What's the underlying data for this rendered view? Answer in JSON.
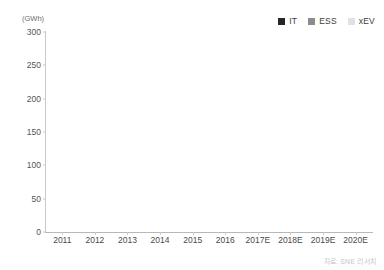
{
  "chart_data": {
    "type": "bar",
    "subtype": "stacked-bar",
    "title": "",
    "subtitle": "",
    "xlabel": "",
    "ylabel": "",
    "unit_label": "(GWh)",
    "categories": [
      "2011",
      "2012",
      "2013",
      "2014",
      "2015",
      "2016",
      "2017E",
      "2018E",
      "2019E",
      "2020E"
    ],
    "series": [
      {
        "name": "IT",
        "color": "#262626",
        "values": [
          28,
          31,
          36,
          42,
          52,
          57,
          62,
          67,
          74,
          88
        ]
      },
      {
        "name": "ESS",
        "color": "#8c8c8c",
        "values": [
          0.5,
          0.8,
          1,
          1.5,
          2,
          3,
          6,
          10,
          16,
          23
        ]
      },
      {
        "name": "xEV",
        "color": "#e9e9e9",
        "values": [
          1,
          2,
          3,
          6,
          12,
          22,
          37,
          62,
          104,
          159
        ]
      }
    ],
    "totals": [
      29.5,
      33.8,
      40,
      49.5,
      66,
      82,
      105,
      139,
      194,
      270
    ],
    "ylim": [
      0,
      300
    ],
    "yticks": [
      0,
      50,
      100,
      150,
      200,
      250,
      300
    ],
    "ytick_labels": [
      "0",
      "50",
      "100",
      "150",
      "200",
      "250",
      "300"
    ],
    "grid": false,
    "legend_position": "top-right",
    "legend": [
      {
        "label": "IT",
        "color": "#262626"
      },
      {
        "label": "ESS",
        "color": "#8c8c8c"
      },
      {
        "label": "xEV",
        "color": "#e2e2e2"
      }
    ]
  },
  "source_note": "자료: SNE 리서치"
}
